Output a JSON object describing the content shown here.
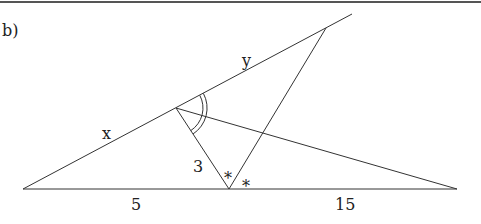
{
  "part_label": "b)",
  "labels": {
    "x": "x",
    "y": "y",
    "three": "3",
    "five": "5",
    "fifteen": "15",
    "star_left": "*",
    "star_right": "*"
  },
  "points": {
    "A_left_base": [
      23,
      189
    ],
    "B_mid_base": [
      229,
      189
    ],
    "C_right_base": [
      457,
      189
    ],
    "D_apex": [
      176,
      108
    ],
    "E_upper": [
      326,
      28
    ],
    "F_line_end": [
      352,
      14
    ]
  },
  "stroke_color": "#333333"
}
